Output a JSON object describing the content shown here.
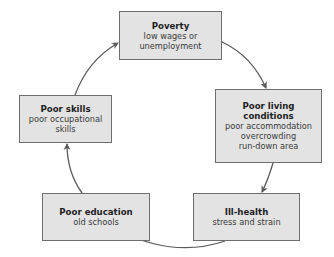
{
  "diagram": {
    "type": "cycle",
    "colors": {
      "box_fill": "#e3e3e3",
      "box_border": "#6e6e6e",
      "arrow": "#5a5a5a",
      "text": "#2a2a2a"
    },
    "nodes": [
      {
        "id": "poverty",
        "title": "Poverty",
        "lines": [
          "low wages or",
          "unemployment"
        ]
      },
      {
        "id": "living",
        "title_lines": [
          "Poor living",
          "conditions"
        ],
        "lines": [
          "poor accommodation",
          "overcrowding",
          "run-down area"
        ]
      },
      {
        "id": "health",
        "title": "Ill-health",
        "lines": [
          "stress and strain"
        ]
      },
      {
        "id": "education",
        "title": "Poor education",
        "lines": [
          "old schools"
        ]
      },
      {
        "id": "skills",
        "title": "Poor skills",
        "lines": [
          "poor occupational",
          "skills"
        ]
      }
    ],
    "edges": [
      {
        "from": "poverty",
        "to": "living"
      },
      {
        "from": "living",
        "to": "health"
      },
      {
        "from": "health",
        "to": "education"
      },
      {
        "from": "education",
        "to": "skills"
      },
      {
        "from": "skills",
        "to": "poverty"
      }
    ]
  }
}
